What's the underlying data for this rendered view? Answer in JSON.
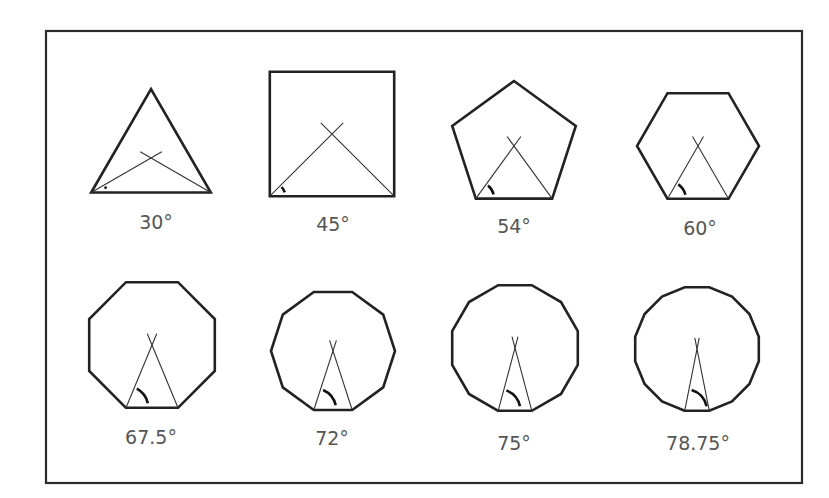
{
  "diagram": {
    "title": "",
    "colors": {
      "stroke": "#222222",
      "label": "#555555",
      "background": "#ffffff"
    },
    "shapes": [
      {
        "name": "triangle",
        "sides": 3,
        "label": "30°",
        "cx": 151,
        "cy": 158,
        "r": 69
      },
      {
        "name": "square",
        "sides": 4,
        "label": "45°",
        "cx": 332,
        "cy": 134,
        "r": 88
      },
      {
        "name": "pentagon",
        "sides": 5,
        "label": "54°",
        "cx": 514,
        "cy": 146,
        "r": 65
      },
      {
        "name": "hexagon",
        "sides": 6,
        "label": "60°",
        "cx": 698,
        "cy": 146,
        "r": 61
      },
      {
        "name": "octagon",
        "sides": 8,
        "label": "67.5°",
        "cx": 152,
        "cy": 345,
        "r": 68
      },
      {
        "name": "decagon",
        "sides": 10,
        "label": "72°",
        "cx": 333,
        "cy": 351,
        "r": 62
      },
      {
        "name": "dodecagon",
        "sides": 12,
        "label": "75°",
        "cx": 515,
        "cy": 348,
        "r": 65
      },
      {
        "name": "hexadecagon",
        "sides": 16,
        "label": "78.75°",
        "cx": 697,
        "cy": 349,
        "r": 63
      }
    ]
  }
}
